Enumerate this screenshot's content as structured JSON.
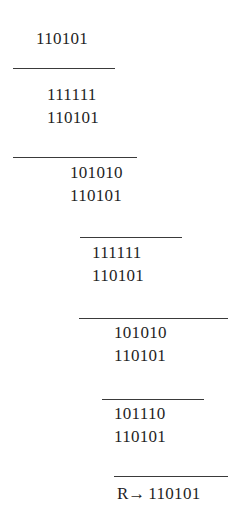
{
  "document": {
    "kind": "binary-long-division-worksheet",
    "background_color": "#ffffff",
    "text_color": "#1f1f1f",
    "rule_color": "#3a3a3a"
  },
  "steps": [
    {
      "id": "dividend",
      "value": "110101",
      "x": 36,
      "y": 29
    },
    {
      "id": "step1_top",
      "value": "111111",
      "x": 47,
      "y": 85
    },
    {
      "id": "step1_bot",
      "value": "110101",
      "x": 47,
      "y": 108
    },
    {
      "id": "step2_top",
      "value": "101010",
      "x": 70,
      "y": 163
    },
    {
      "id": "step2_bot",
      "value": "110101",
      "x": 70,
      "y": 186
    },
    {
      "id": "step3_top",
      "value": "111111",
      "x": 92,
      "y": 243
    },
    {
      "id": "step3_bot",
      "value": "110101",
      "x": 92,
      "y": 266
    },
    {
      "id": "step4_top",
      "value": "101010",
      "x": 114,
      "y": 323
    },
    {
      "id": "step4_bot",
      "value": "110101",
      "x": 114,
      "y": 346
    },
    {
      "id": "step5_top",
      "value": "101110",
      "x": 114,
      "y": 404
    },
    {
      "id": "step5_bot",
      "value": "110101",
      "x": 114,
      "y": 427
    }
  ],
  "rules": [
    {
      "id": "rule1",
      "x": 13,
      "y": 68,
      "width": 102
    },
    {
      "id": "rule2",
      "x": 13,
      "y": 157,
      "width": 124
    },
    {
      "id": "rule3",
      "x": 80,
      "y": 237,
      "width": 102
    },
    {
      "id": "rule4",
      "x": 79,
      "y": 318,
      "width": 149
    },
    {
      "id": "rule5",
      "x": 102,
      "y": 399,
      "width": 102
    },
    {
      "id": "rule6",
      "x": 114,
      "y": 476,
      "width": 114
    }
  ],
  "result": {
    "id": "remainder",
    "label": "R",
    "arrow": "→",
    "value": "110101",
    "x": 117,
    "y": 484
  }
}
